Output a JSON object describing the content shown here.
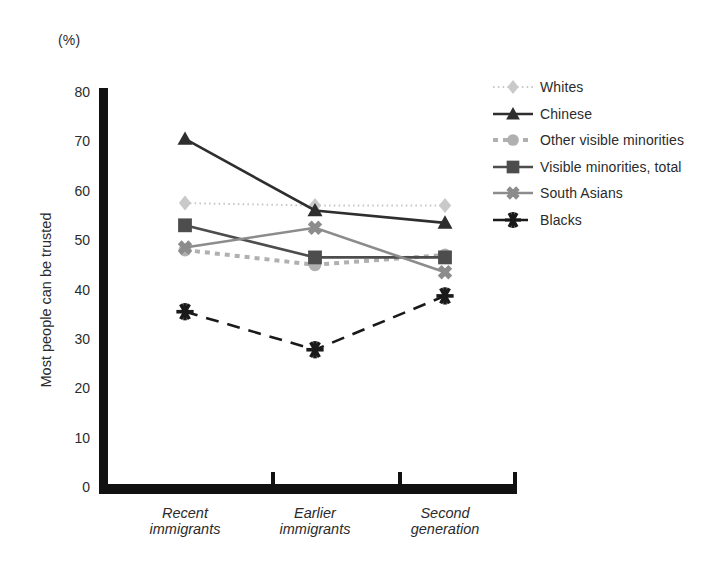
{
  "chart_data": {
    "type": "line",
    "title": "",
    "unit_label": "(%)",
    "ylabel": "Most people can be trusted",
    "xlabel": "",
    "categories": [
      "Recent immigrants",
      "Earlier immigrants",
      "Second generation"
    ],
    "category_lines": [
      [
        "Recent",
        "immigrants"
      ],
      [
        "Earlier",
        "immigrants"
      ],
      [
        "Second",
        "generation"
      ]
    ],
    "ylim": [
      0,
      80
    ],
    "yticks": [
      80,
      70,
      60,
      50,
      40,
      30,
      20,
      10,
      0
    ],
    "grid": false,
    "legend_position": "right",
    "series": [
      {
        "name": "Whites",
        "values": [
          57.5,
          57.0,
          57.0
        ],
        "color": "#c9c9c9",
        "marker": "diamond",
        "linestyle": "dotted"
      },
      {
        "name": "Chinese",
        "values": [
          70.5,
          56.0,
          53.5
        ],
        "color": "#2e2e2e",
        "marker": "triangle",
        "linestyle": "solid"
      },
      {
        "name": "Other visible minorities",
        "values": [
          48.0,
          45.0,
          47.0
        ],
        "color": "#b0b0b0",
        "marker": "circle",
        "linestyle": "dashed"
      },
      {
        "name": "Visible minorities, total",
        "values": [
          53.0,
          46.5,
          46.5
        ],
        "color": "#4d4d4d",
        "marker": "square",
        "linestyle": "solid"
      },
      {
        "name": "South Asians",
        "values": [
          48.5,
          52.5,
          43.5
        ],
        "color": "#8c8c8c",
        "marker": "cross-x",
        "linestyle": "solid"
      },
      {
        "name": "Blacks",
        "values": [
          35.5,
          27.8,
          38.7
        ],
        "color": "#1a1a1a",
        "marker": "asterisk",
        "linestyle": "long-dash"
      }
    ]
  }
}
